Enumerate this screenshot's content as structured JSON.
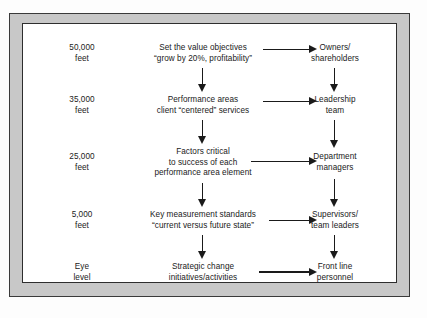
{
  "figure": {
    "type": "flow-diagram",
    "columns": [
      "altitude",
      "strategic_content",
      "responsible_party"
    ],
    "rows": [
      {
        "altitude": [
          "50,000",
          "feet"
        ],
        "content": [
          "Set the value objectives",
          "“grow by 20%, profitability”"
        ],
        "role": [
          "Owners/",
          "shareholders"
        ]
      },
      {
        "altitude": [
          "35,000",
          "feet"
        ],
        "content": [
          "Performance areas",
          "client “centered” services"
        ],
        "role": [
          "Leadership",
          "team"
        ]
      },
      {
        "altitude": [
          "25,000",
          "feet"
        ],
        "content": [
          "Factors critical",
          "to success of each",
          "performance area element"
        ],
        "role": [
          "Department",
          "managers"
        ]
      },
      {
        "altitude": [
          "5,000",
          "feet"
        ],
        "content": [
          "Key measurement standards",
          "“current versus future state”"
        ],
        "role": [
          "Supervisors/",
          "team leaders"
        ]
      },
      {
        "altitude": [
          "Eye",
          "level"
        ],
        "content": [
          "Strategic change",
          "initiatives/activities"
        ],
        "role": [
          "Front line",
          "personnel"
        ]
      }
    ]
  },
  "colors": {
    "frame_fill": "#c8c8c8",
    "frame_border": "#3a3a3a",
    "panel_fill": "#ffffff",
    "text": "#1a1a1a",
    "arrow": "#1a1a1a"
  }
}
